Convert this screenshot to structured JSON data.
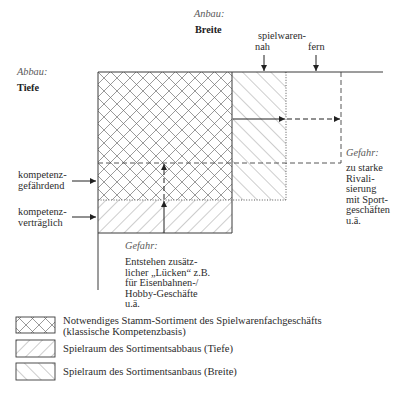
{
  "diagram": {
    "anbau": {
      "label": "Anbau:",
      "dimension": "Breite"
    },
    "abbau": {
      "label": "Abbau:",
      "dimension": "Tiefe"
    },
    "breite_markers": {
      "prefix": "spielwaren-",
      "near": "nah",
      "far": "fern"
    },
    "tiefe_markers": [
      {
        "line1": "kompetenz-",
        "line2": "gefährdend"
      },
      {
        "line1": "kompetenz-",
        "line2": "verträglich"
      }
    ],
    "dangers": [
      {
        "title": "Gefahr:",
        "lines": [
          "zu starke",
          "Rivali-",
          "sierung",
          "mit Sport-",
          "geschäften",
          "u.ä."
        ]
      },
      {
        "title": "Gefahr:",
        "lines": [
          "Entstehen zusätz-",
          "licher „Lücken“ z.B.",
          "für Eisenbahnen-/",
          "Hobby-Geschäfte",
          "u.ä."
        ]
      }
    ]
  },
  "legend": [
    {
      "pattern": "crosshatch",
      "line1": "Notwendiges Stamm-Sortiment des Spielwarenfachgeschäfts",
      "line2": "(klassische Kompetenzbasis)"
    },
    {
      "pattern": "forward-hatch",
      "line1": "Spielraum des Sortimentsabbaus (Tiefe)"
    },
    {
      "pattern": "backward-hatch",
      "line1": "Spielraum des Sortimentsanbaus (Breite)"
    }
  ],
  "colors": {
    "line": "#3a3a3a",
    "hatch": "#6e6e6e",
    "text": "#2b2b2b",
    "italic_text": "#5a5a5a",
    "background": "#ffffff"
  }
}
